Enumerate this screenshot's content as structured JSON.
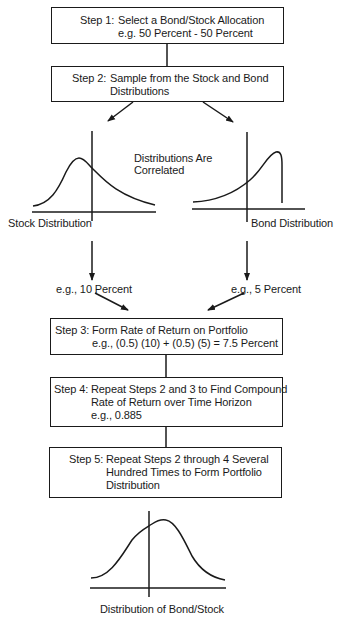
{
  "steps": [
    {
      "id": "step-1",
      "prefix": "Step 1:",
      "lines": [
        "Select a Bond/Stock Allocation",
        "e.g. 50 Percent - 50 Percent"
      ]
    },
    {
      "id": "step-2",
      "prefix": "Step 2:",
      "lines": [
        "Sample from the Stock and Bond",
        "Distributions"
      ]
    },
    {
      "id": "step-3",
      "prefix": "Step 3:",
      "lines": [
        "Form Rate of Return on Portfolio",
        "e.g., (0.5) (10) + (0.5) (5) = 7.5 Percent"
      ]
    },
    {
      "id": "step-4",
      "prefix": "Step 4:",
      "lines": [
        "Repeat Steps 2 and 3 to Find Compound",
        "Rate of Return over Time Horizon",
        "e.g., 0.885"
      ]
    },
    {
      "id": "step-5",
      "prefix": "Step 5:",
      "lines": [
        "Repeat Steps 2 through 4 Several",
        "Hundred Times to Form Portfolio",
        "Distribution"
      ]
    }
  ],
  "distributions": {
    "correlation_note": [
      "Distributions Are",
      "Correlated"
    ],
    "stock": {
      "label": "Stock Distribution",
      "sample": "e.g., 10 Percent",
      "shape": "right-skewed"
    },
    "bond": {
      "label": "Bond Distribution",
      "sample": "e.g., 5 Percent",
      "shape": "left-skewed, truncated"
    },
    "portfolio": {
      "label": "Distribution of Bond/Stock",
      "shape": "approximately normal"
    }
  },
  "colors": {
    "ink": "#1a1a1a",
    "background": "#ffffff"
  }
}
